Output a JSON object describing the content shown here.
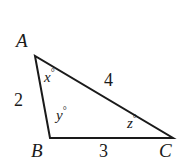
{
  "figure": {
    "kind": "triangle-diagram",
    "shape": "scalene-triangle",
    "width": 190,
    "height": 167,
    "background_color": "#ffffff",
    "stroke_color": "#1a1a1a",
    "text_color": "#1a1a1a"
  },
  "vertices": {
    "A": {
      "label": "A",
      "x": 35,
      "y": 56
    },
    "B": {
      "label": "B",
      "x": 50,
      "y": 138
    },
    "C": {
      "label": "C",
      "x": 173,
      "y": 138
    }
  },
  "sides": {
    "AB": {
      "label": "2",
      "value": 2
    },
    "AC": {
      "label": "4",
      "value": 4
    },
    "BC": {
      "label": "3",
      "value": 3
    }
  },
  "angles": {
    "at_A": {
      "variable": "x",
      "degree_symbol": "°",
      "label": "x°"
    },
    "at_B": {
      "variable": "y",
      "degree_symbol": "°",
      "label": "y°"
    },
    "at_C": {
      "variable": "z",
      "degree_symbol": "°",
      "label": "z°"
    }
  },
  "chart_data": {
    "type": "diagram",
    "title": "",
    "points": [
      {
        "name": "A",
        "x": 35,
        "y": 56
      },
      {
        "name": "B",
        "x": 50,
        "y": 138
      },
      {
        "name": "C",
        "x": 173,
        "y": 138
      }
    ],
    "edges": [
      {
        "from": "A",
        "to": "B",
        "length_label": "2"
      },
      {
        "from": "A",
        "to": "C",
        "length_label": "4"
      },
      {
        "from": "B",
        "to": "C",
        "length_label": "3"
      }
    ],
    "angle_labels": [
      "x°",
      "y°",
      "z°"
    ]
  }
}
